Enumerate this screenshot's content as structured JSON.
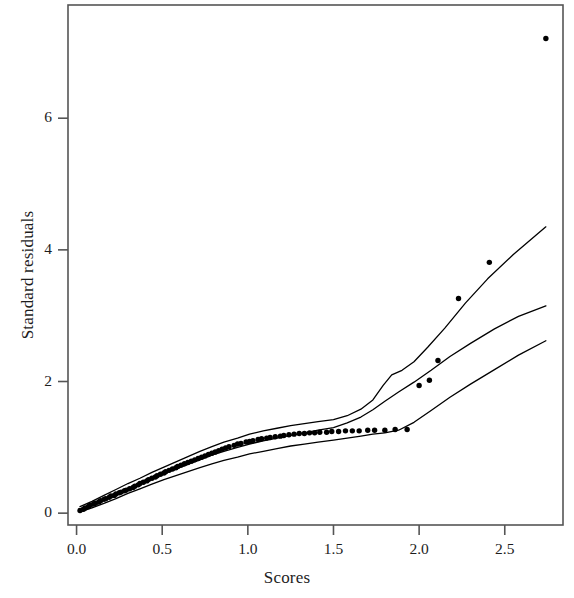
{
  "chart_data": {
    "type": "scatter",
    "title": "",
    "subtitle": "",
    "xlabel": "Scores",
    "ylabel": "Standard residuals",
    "xlim": [
      -0.05,
      2.84
    ],
    "ylim": [
      -0.18,
      7.72
    ],
    "xticks": [
      0.0,
      0.5,
      1.0,
      1.5,
      2.0,
      2.5
    ],
    "xticklabels": [
      "0.0",
      "0.5",
      "1.0",
      "1.5",
      "2.0",
      "2.5"
    ],
    "yticks": [
      0,
      2,
      4,
      6
    ],
    "yticklabels": [
      "0",
      "2",
      "4",
      "6"
    ],
    "grid": false,
    "legend": null,
    "annotations": [],
    "point_color": "#000000",
    "line_color": "#000000",
    "axis_color": "#555555",
    "background": "#ffffff",
    "series": [
      {
        "name": "observed standard residuals",
        "type": "scatter",
        "marker": "filled-circle",
        "points": [
          [
            0.02,
            0.04
          ],
          [
            0.04,
            0.06
          ],
          [
            0.05,
            0.08
          ],
          [
            0.07,
            0.1
          ],
          [
            0.08,
            0.12
          ],
          [
            0.1,
            0.14
          ],
          [
            0.11,
            0.15
          ],
          [
            0.13,
            0.17
          ],
          [
            0.14,
            0.19
          ],
          [
            0.16,
            0.21
          ],
          [
            0.17,
            0.22
          ],
          [
            0.19,
            0.24
          ],
          [
            0.2,
            0.26
          ],
          [
            0.22,
            0.27
          ],
          [
            0.23,
            0.29
          ],
          [
            0.25,
            0.31
          ],
          [
            0.26,
            0.32
          ],
          [
            0.28,
            0.34
          ],
          [
            0.29,
            0.35
          ],
          [
            0.31,
            0.37
          ],
          [
            0.33,
            0.39
          ],
          [
            0.34,
            0.41
          ],
          [
            0.36,
            0.43
          ],
          [
            0.37,
            0.45
          ],
          [
            0.39,
            0.47
          ],
          [
            0.41,
            0.49
          ],
          [
            0.42,
            0.51
          ],
          [
            0.44,
            0.53
          ],
          [
            0.46,
            0.55
          ],
          [
            0.47,
            0.57
          ],
          [
            0.49,
            0.59
          ],
          [
            0.51,
            0.61
          ],
          [
            0.52,
            0.63
          ],
          [
            0.54,
            0.65
          ],
          [
            0.56,
            0.67
          ],
          [
            0.58,
            0.69
          ],
          [
            0.59,
            0.71
          ],
          [
            0.61,
            0.73
          ],
          [
            0.63,
            0.75
          ],
          [
            0.65,
            0.77
          ],
          [
            0.67,
            0.79
          ],
          [
            0.69,
            0.81
          ],
          [
            0.71,
            0.83
          ],
          [
            0.73,
            0.85
          ],
          [
            0.75,
            0.87
          ],
          [
            0.77,
            0.89
          ],
          [
            0.79,
            0.91
          ],
          [
            0.81,
            0.93
          ],
          [
            0.83,
            0.95
          ],
          [
            0.85,
            0.97
          ],
          [
            0.87,
            0.99
          ],
          [
            0.89,
            1.01
          ],
          [
            0.92,
            1.03
          ],
          [
            0.94,
            1.05
          ],
          [
            0.96,
            1.06
          ],
          [
            0.99,
            1.08
          ],
          [
            1.01,
            1.09
          ],
          [
            1.03,
            1.1
          ],
          [
            1.06,
            1.12
          ],
          [
            1.08,
            1.13
          ],
          [
            1.11,
            1.14
          ],
          [
            1.13,
            1.15
          ],
          [
            1.16,
            1.16
          ],
          [
            1.19,
            1.17
          ],
          [
            1.21,
            1.18
          ],
          [
            1.24,
            1.19
          ],
          [
            1.27,
            1.2
          ],
          [
            1.3,
            1.21
          ],
          [
            1.33,
            1.21
          ],
          [
            1.36,
            1.22
          ],
          [
            1.39,
            1.22
          ],
          [
            1.42,
            1.23
          ],
          [
            1.46,
            1.23
          ],
          [
            1.49,
            1.24
          ],
          [
            1.53,
            1.24
          ],
          [
            1.57,
            1.25
          ],
          [
            1.61,
            1.25
          ],
          [
            1.65,
            1.25
          ],
          [
            1.7,
            1.26
          ],
          [
            1.74,
            1.26
          ],
          [
            1.8,
            1.26
          ],
          [
            1.86,
            1.27
          ],
          [
            1.93,
            1.27
          ],
          [
            2.0,
            1.94
          ],
          [
            2.06,
            2.02
          ],
          [
            2.11,
            2.32
          ],
          [
            2.23,
            3.26
          ],
          [
            2.41,
            3.81
          ],
          [
            2.74,
            7.21
          ]
        ]
      },
      {
        "name": "upper envelope",
        "type": "line",
        "points": [
          [
            0.02,
            0.1
          ],
          [
            0.09,
            0.18
          ],
          [
            0.16,
            0.27
          ],
          [
            0.23,
            0.36
          ],
          [
            0.3,
            0.45
          ],
          [
            0.37,
            0.53
          ],
          [
            0.44,
            0.62
          ],
          [
            0.51,
            0.7
          ],
          [
            0.58,
            0.78
          ],
          [
            0.65,
            0.86
          ],
          [
            0.72,
            0.94
          ],
          [
            0.79,
            1.01
          ],
          [
            0.86,
            1.08
          ],
          [
            0.94,
            1.14
          ],
          [
            1.01,
            1.2
          ],
          [
            1.09,
            1.25
          ],
          [
            1.17,
            1.29
          ],
          [
            1.25,
            1.33
          ],
          [
            1.33,
            1.36
          ],
          [
            1.41,
            1.39
          ],
          [
            1.5,
            1.42
          ],
          [
            1.58,
            1.48
          ],
          [
            1.66,
            1.58
          ],
          [
            1.73,
            1.72
          ],
          [
            1.79,
            1.94
          ],
          [
            1.84,
            2.1
          ],
          [
            1.9,
            2.17
          ],
          [
            1.97,
            2.3
          ],
          [
            2.05,
            2.52
          ],
          [
            2.15,
            2.81
          ],
          [
            2.27,
            3.19
          ],
          [
            2.4,
            3.56
          ],
          [
            2.55,
            3.93
          ],
          [
            2.74,
            4.35
          ]
        ]
      },
      {
        "name": "median envelope",
        "type": "line",
        "points": [
          [
            0.02,
            0.05
          ],
          [
            0.09,
            0.12
          ],
          [
            0.16,
            0.2
          ],
          [
            0.23,
            0.28
          ],
          [
            0.3,
            0.36
          ],
          [
            0.37,
            0.44
          ],
          [
            0.44,
            0.52
          ],
          [
            0.51,
            0.6
          ],
          [
            0.58,
            0.67
          ],
          [
            0.65,
            0.74
          ],
          [
            0.72,
            0.81
          ],
          [
            0.79,
            0.88
          ],
          [
            0.86,
            0.94
          ],
          [
            0.94,
            1.0
          ],
          [
            1.01,
            1.05
          ],
          [
            1.09,
            1.1
          ],
          [
            1.17,
            1.14
          ],
          [
            1.25,
            1.18
          ],
          [
            1.33,
            1.22
          ],
          [
            1.41,
            1.26
          ],
          [
            1.5,
            1.3
          ],
          [
            1.58,
            1.37
          ],
          [
            1.66,
            1.46
          ],
          [
            1.73,
            1.57
          ],
          [
            1.8,
            1.7
          ],
          [
            1.88,
            1.84
          ],
          [
            1.97,
            1.99
          ],
          [
            2.07,
            2.17
          ],
          [
            2.18,
            2.38
          ],
          [
            2.3,
            2.58
          ],
          [
            2.44,
            2.8
          ],
          [
            2.58,
            2.99
          ],
          [
            2.74,
            3.15
          ]
        ]
      },
      {
        "name": "lower envelope",
        "type": "line",
        "points": [
          [
            0.02,
            0.02
          ],
          [
            0.09,
            0.08
          ],
          [
            0.16,
            0.15
          ],
          [
            0.23,
            0.22
          ],
          [
            0.3,
            0.3
          ],
          [
            0.37,
            0.37
          ],
          [
            0.44,
            0.44
          ],
          [
            0.51,
            0.51
          ],
          [
            0.58,
            0.57
          ],
          [
            0.65,
            0.63
          ],
          [
            0.72,
            0.69
          ],
          [
            0.79,
            0.75
          ],
          [
            0.86,
            0.8
          ],
          [
            0.94,
            0.85
          ],
          [
            1.01,
            0.9
          ],
          [
            1.09,
            0.94
          ],
          [
            1.17,
            0.98
          ],
          [
            1.25,
            1.02
          ],
          [
            1.33,
            1.05
          ],
          [
            1.41,
            1.08
          ],
          [
            1.5,
            1.11
          ],
          [
            1.58,
            1.14
          ],
          [
            1.66,
            1.17
          ],
          [
            1.73,
            1.2
          ],
          [
            1.8,
            1.22
          ],
          [
            1.88,
            1.26
          ],
          [
            1.97,
            1.38
          ],
          [
            2.07,
            1.56
          ],
          [
            2.18,
            1.76
          ],
          [
            2.3,
            1.96
          ],
          [
            2.44,
            2.18
          ],
          [
            2.58,
            2.4
          ],
          [
            2.74,
            2.62
          ]
        ]
      }
    ]
  },
  "axes": {
    "x_title": "Scores",
    "y_title": "Standard residuals",
    "x_tick_labels": [
      "0.0",
      "0.5",
      "1.0",
      "1.5",
      "2.0",
      "2.5"
    ],
    "y_tick_labels": [
      "0",
      "2",
      "4",
      "6"
    ]
  }
}
